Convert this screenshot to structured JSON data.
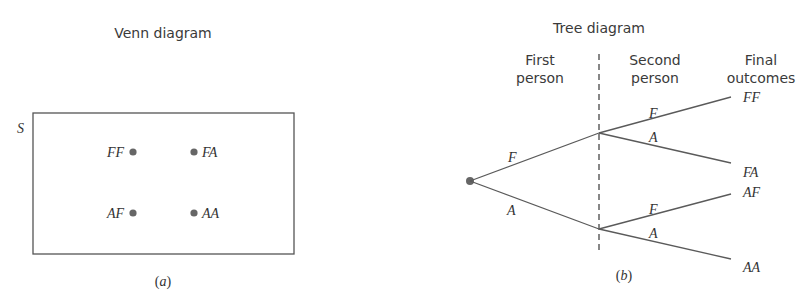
{
  "venn": {
    "title": "Venn diagram",
    "set_label": "S",
    "caption": "(a)",
    "points": [
      {
        "label": "FF",
        "x": 133,
        "y": 152,
        "label_side": "left"
      },
      {
        "label": "FA",
        "x": 194,
        "y": 152,
        "label_side": "right"
      },
      {
        "label": "AF",
        "x": 133,
        "y": 213,
        "label_side": "left"
      },
      {
        "label": "AA",
        "x": 194,
        "y": 213,
        "label_side": "right"
      }
    ]
  },
  "tree": {
    "title": "Tree diagram",
    "column_headers": {
      "first": [
        "First",
        "person"
      ],
      "second": [
        "Second",
        "person"
      ],
      "final": [
        "Final",
        "outcomes"
      ]
    },
    "first_branches": [
      {
        "label": "F"
      },
      {
        "label": "A"
      }
    ],
    "second_branches": [
      {
        "label": "F",
        "outcome": "FF"
      },
      {
        "label": "A",
        "outcome": "FA"
      },
      {
        "label": "F",
        "outcome": "AF"
      },
      {
        "label": "A",
        "outcome": "AA"
      }
    ],
    "caption": "(b)"
  },
  "colors": {
    "line": "#5a5a5a",
    "dot": "#666666",
    "text": "#333333"
  }
}
